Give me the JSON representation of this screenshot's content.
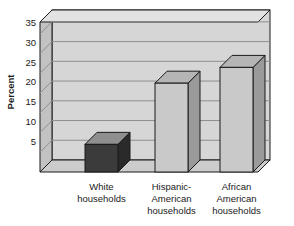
{
  "chart_data": {
    "type": "bar",
    "title": "",
    "subtitle": "",
    "xlabel": "",
    "ylabel": "Percent",
    "categories": [
      "White households",
      "Hispanic-American households",
      "African American households"
    ],
    "category_lines": [
      [
        "White",
        "households"
      ],
      [
        "Hispanic-",
        "American",
        "households"
      ],
      [
        "African",
        "American",
        "households"
      ]
    ],
    "values": [
      7,
      22.5,
      26.5
    ],
    "ylim": [
      0,
      38
    ],
    "yticks": [
      5,
      10,
      15,
      20,
      25,
      30,
      35
    ],
    "ytick_labels": [
      "5",
      "10",
      "15",
      "20",
      "25",
      "30",
      "35"
    ],
    "grid": true,
    "legend": "none",
    "style": "3d-column"
  },
  "colors": {
    "plot_background": "#d6d6d6",
    "plot_side_wall": "#c2c2c2",
    "plot_floor": "#cccccc",
    "bar_front_default": "#c9c9c9",
    "bar_front_highlight": "#3b3b3b",
    "bar_top": "#b5b5b5",
    "bar_side": "#9a9a9a",
    "bar_top_highlight": "#8f8f8f",
    "bar_side_highlight": "#2a2a2a",
    "outline": "#1a1a1a",
    "gridline": "#8f8f8f",
    "text": "#1a1a1a",
    "page_background": "#ffffff"
  },
  "bar_styles": [
    "highlight",
    "default",
    "default"
  ]
}
